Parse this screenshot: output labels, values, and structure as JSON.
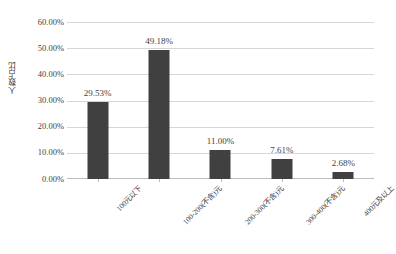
{
  "chart_data": {
    "type": "bar",
    "title": "",
    "xlabel": "",
    "ylabel": "人数占比",
    "categories": [
      "100元以下",
      "100-200(不含)元",
      "200-300(不含)元",
      "300-400(不含)元",
      "400元及以上"
    ],
    "values": [
      29.53,
      49.18,
      11.0,
      7.61,
      2.68
    ],
    "data_labels": [
      "29.53%",
      "49.18%",
      "11.00%",
      "7.61%",
      "2.68%"
    ],
    "ylim": [
      0,
      60
    ],
    "ytick_values": [
      0,
      10,
      20,
      30,
      40,
      50,
      60
    ],
    "ytick_labels": [
      "0.00%",
      "10.00%",
      "20.00%",
      "30.00%",
      "40.00%",
      "50.00%",
      "60.00%"
    ],
    "grid": true,
    "legend": false,
    "legend_position": "none",
    "series_color": "#404040",
    "gridline_color": "#d6d6d6",
    "axis_color": "#bdbdbd",
    "background_color": "#ffffff",
    "text_color": "#3f3f3f"
  }
}
